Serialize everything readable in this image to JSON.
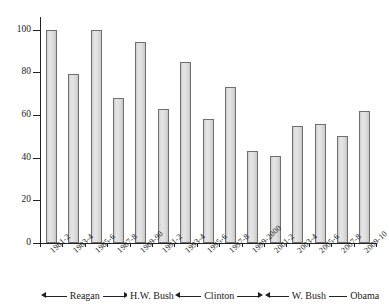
{
  "chart_data": {
    "type": "bar",
    "title": "",
    "subtitle": "",
    "xlabel": "",
    "ylabel": "",
    "grid": false,
    "legend": "none",
    "ylim": [
      0,
      105
    ],
    "yticks": [
      0,
      20,
      40,
      60,
      80,
      100
    ],
    "ytick_labels": [
      "0",
      "20",
      "40",
      "60",
      "80",
      "100"
    ],
    "categories": [
      "1981-2",
      "1983-4",
      "1985-6",
      "1987-8",
      "1989-90",
      "1991-2",
      "1993-4",
      "1995-6",
      "1997-8",
      "1999-2000",
      "2001-2",
      "2003-4",
      "2005-6",
      "2007-8",
      "2009-10"
    ],
    "values": [
      100,
      79,
      100,
      68,
      94,
      63,
      85,
      58,
      73,
      43,
      41,
      55,
      56,
      50,
      62
    ],
    "bar_fill": "#dcdcdc",
    "bar_stroke": "#6f6f6f",
    "axis_color": "#222222"
  },
  "eras": [
    {
      "name": "Reagan",
      "start_index": 0,
      "end_index": 3,
      "arrows": "both"
    },
    {
      "name": "H.W. Bush",
      "start_index": 4,
      "end_index": 5,
      "arrows": "none"
    },
    {
      "name": "Clinton",
      "start_index": 6,
      "end_index": 9,
      "arrows": "both"
    },
    {
      "name": "W. Bush",
      "start_index": 10,
      "end_index": 13,
      "arrows": "both"
    },
    {
      "name": "Obama",
      "start_index": 14,
      "end_index": 14,
      "arrows": "none"
    }
  ]
}
